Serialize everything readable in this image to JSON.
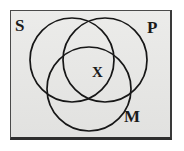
{
  "figure": {
    "kind": "venn-diagram",
    "circle_count": 3,
    "background_color": "#e9e9e7",
    "frame_color": "#4a4a4a",
    "stroke_color": "#171717"
  },
  "labels": {
    "subject": "S",
    "predicate": "P",
    "middle": "M",
    "mark": "X"
  },
  "chart_data": {
    "type": "diagram",
    "title": "",
    "shapes": [
      {
        "name": "circle-s",
        "label": "S",
        "cx": 72,
        "cy": 60,
        "r": 42
      },
      {
        "name": "circle-p",
        "label": "P",
        "cx": 105,
        "cy": 60,
        "r": 42
      },
      {
        "name": "circle-m",
        "label": "M",
        "cx": 89,
        "cy": 89,
        "r": 42
      }
    ],
    "marks": [
      {
        "name": "x-mark",
        "text": "X",
        "x": 97,
        "y": 73,
        "region": "S-and-P-and-M"
      }
    ],
    "frame": {
      "x": 10,
      "y": 10,
      "width": 162,
      "height": 130
    }
  }
}
